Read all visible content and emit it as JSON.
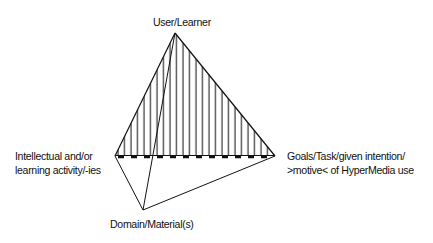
{
  "diagram": {
    "type": "tetrahedron",
    "vertices": {
      "top": {
        "label": "User/Learner"
      },
      "left": {
        "label_lines": [
          "Intellectual and/or",
          "learning activity/-ies"
        ]
      },
      "right": {
        "label_lines": [
          "Goals/Task/given intention/",
          ">motive< of HyperMedia use"
        ]
      },
      "bottom": {
        "label": "Domain/Material(s)"
      }
    },
    "shaded_face": [
      "User/Learner",
      "Intellectual and/or learning activity/-ies",
      "Goals/Task/given intention/ >motive< of HyperMedia use"
    ],
    "colors": {
      "line": "#111111",
      "hatch": "#333333",
      "background": "#ffffff"
    }
  }
}
